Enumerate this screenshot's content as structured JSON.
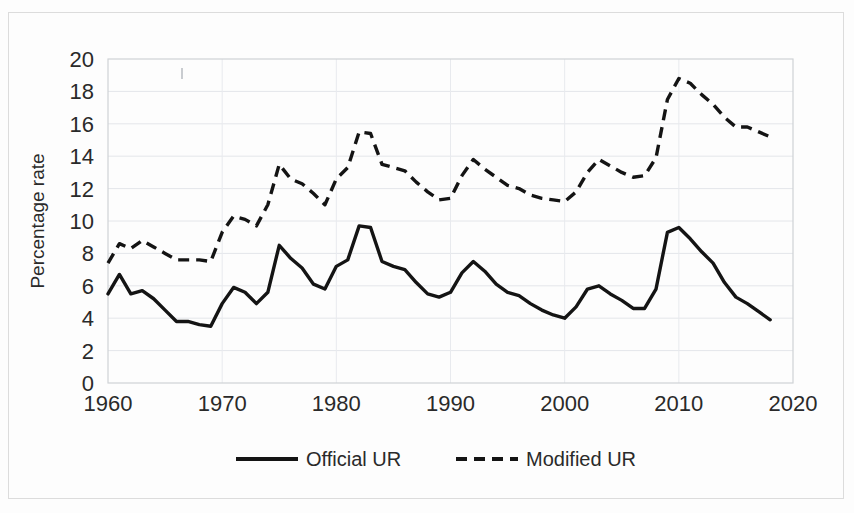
{
  "chart_data": {
    "type": "line",
    "title": "",
    "xlabel": "",
    "ylabel": "Percentage rate",
    "xlim": [
      1960,
      2020
    ],
    "ylim": [
      0,
      20
    ],
    "grid": true,
    "legend_position": "bottom",
    "xticks": [
      "1960",
      "1970",
      "1980",
      "1990",
      "2000",
      "2010",
      "2020"
    ],
    "xtick_values": [
      1960,
      1970,
      1980,
      1990,
      2000,
      2010,
      2020
    ],
    "yticks": [
      "0",
      "2",
      "4",
      "6",
      "8",
      "10",
      "12",
      "14",
      "16",
      "18",
      "20"
    ],
    "ytick_values": [
      0,
      2,
      4,
      6,
      8,
      10,
      12,
      14,
      16,
      18,
      20
    ],
    "x": [
      1960,
      1961,
      1962,
      1963,
      1964,
      1965,
      1966,
      1967,
      1968,
      1969,
      1970,
      1971,
      1972,
      1973,
      1974,
      1975,
      1976,
      1977,
      1978,
      1979,
      1980,
      1981,
      1982,
      1983,
      1984,
      1985,
      1986,
      1987,
      1988,
      1989,
      1990,
      1991,
      1992,
      1993,
      1994,
      1995,
      1996,
      1997,
      1998,
      1999,
      2000,
      2001,
      2002,
      2003,
      2004,
      2005,
      2006,
      2007,
      2008,
      2009,
      2010,
      2011,
      2012,
      2013,
      2014,
      2015,
      2016,
      2017,
      2018
    ],
    "series": [
      {
        "name": "Official UR",
        "style": "solid",
        "values": [
          5.5,
          6.7,
          5.5,
          5.7,
          5.2,
          4.5,
          3.8,
          3.8,
          3.6,
          3.5,
          4.9,
          5.9,
          5.6,
          4.9,
          5.6,
          8.5,
          7.7,
          7.1,
          6.1,
          5.8,
          7.2,
          7.6,
          9.7,
          9.6,
          7.5,
          7.2,
          7.0,
          6.2,
          5.5,
          5.3,
          5.6,
          6.8,
          7.5,
          6.9,
          6.1,
          5.6,
          5.4,
          4.9,
          4.5,
          4.2,
          4.0,
          4.7,
          5.8,
          6.0,
          5.5,
          5.1,
          4.6,
          4.6,
          5.8,
          9.3,
          9.6,
          8.9,
          8.1,
          7.4,
          6.2,
          5.3,
          4.9,
          4.4,
          3.9
        ]
      },
      {
        "name": "Modified UR",
        "style": "dashed",
        "values": [
          7.4,
          8.6,
          8.3,
          8.8,
          8.4,
          8.0,
          7.6,
          7.6,
          7.6,
          7.5,
          9.3,
          10.3,
          10.1,
          9.7,
          11.0,
          13.5,
          12.6,
          12.3,
          11.7,
          11.0,
          12.6,
          13.3,
          15.5,
          15.4,
          13.5,
          13.3,
          13.1,
          12.4,
          11.8,
          11.3,
          11.4,
          12.8,
          13.8,
          13.2,
          12.7,
          12.2,
          12.0,
          11.6,
          11.4,
          11.3,
          11.2,
          11.8,
          13.0,
          13.8,
          13.4,
          13.0,
          12.7,
          12.8,
          13.9,
          17.5,
          18.8,
          18.5,
          17.8,
          17.2,
          16.4,
          15.8,
          15.8,
          15.5,
          15.2
        ]
      }
    ],
    "legend": [
      {
        "label": "Official UR",
        "style": "solid"
      },
      {
        "label": "Modified UR",
        "style": "dashed"
      }
    ]
  }
}
